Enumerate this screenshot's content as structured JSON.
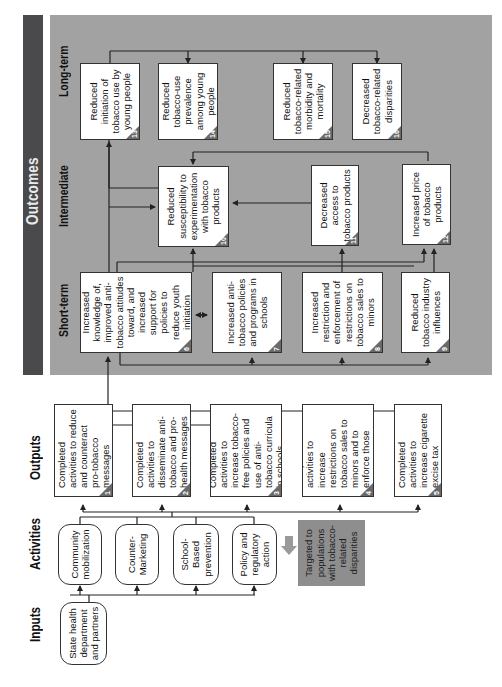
{
  "diagram": {
    "orientation": "rotated-90-ccw",
    "columns": {
      "inputs": "Inputs",
      "activities": "Activities",
      "outputs": "Outputs",
      "outcomes": "Outcomes"
    },
    "outcome_stages": {
      "short_term": "Short-term",
      "intermediate": "Intermediate",
      "long_term": "Long-term"
    },
    "inputs": [
      {
        "label": "State health department and partners"
      }
    ],
    "activities": [
      {
        "label": "Community mobilization"
      },
      {
        "label": "Counter-Marketing"
      },
      {
        "label": "School-Based prevention"
      },
      {
        "label": "Policy and regulatory action"
      }
    ],
    "targeted_note": "Targeted to populations with tobacco-related disparities",
    "outputs": [
      {
        "num": "1",
        "label": "Completed activities to reduce and counteract pro-tobacco messages"
      },
      {
        "num": "2",
        "label": "Completed activities to disseminate anti-tobacco and pro-health messages"
      },
      {
        "num": "3",
        "label": "Completed activities to increase tobacco-free policies and use of anti-tobacco curricula in schools"
      },
      {
        "num": "4",
        "label": "Completed activities to increase restrictions on tobacco sales to minors and to enforce those restrictions"
      },
      {
        "num": "5",
        "label": "Completed activities to increase cigarette excise tax"
      }
    ],
    "short_term": [
      {
        "num": "6",
        "label": "Increased knowledge of, improved anti-tobacco attitudes toward, and increased support for policies to reduce youth initiation"
      },
      {
        "num": "7",
        "label": "Increased anti-tobacco policies and programs in schools"
      },
      {
        "num": "8",
        "label": "Increased restriction and enforcement of restrictions on tobacco sales to minors"
      },
      {
        "num": "9",
        "label": "Reduced tobacco industry influences"
      }
    ],
    "intermediate": [
      {
        "num": "10",
        "label": "Reduced susceptibility to experimentation with tobacco products"
      },
      {
        "num": "11",
        "label": "Decreased access to tobacco products"
      },
      {
        "num": "12",
        "label": "Increased price of tobacco products"
      }
    ],
    "long_term": [
      {
        "num": "13",
        "label": "Reduced initiation of tobacco use by young people"
      },
      {
        "num": "14",
        "label": "Reduced tobacco-use prevalence among young people"
      },
      {
        "num": "15",
        "label": "Reduced tobacco-related morbidity and mortality"
      },
      {
        "num": "16",
        "label": "Decreased tobacco-related disparities"
      }
    ]
  },
  "colors": {
    "outcomes_band": "#4a4a4c",
    "outcomes_panel": "#a2a2a2",
    "targeted_box": "#8e8e8e",
    "box_fill": "#ffffff",
    "line": "#222222"
  }
}
